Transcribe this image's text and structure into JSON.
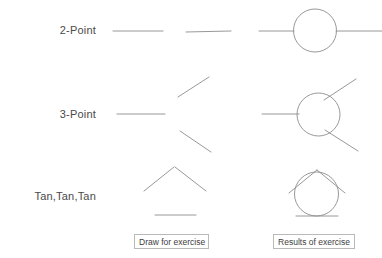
{
  "page": {
    "background_color": "#ffffff",
    "ink_color": "#8c8c8c",
    "text_color": "#3d3d3d",
    "width": 382,
    "height": 258
  },
  "rows": [
    {
      "id": "2-point",
      "label": "2-Point"
    },
    {
      "id": "3-point",
      "label": "3-Point"
    },
    {
      "id": "tan-tan-tan",
      "label": "Tan,Tan,Tan"
    }
  ],
  "captions": {
    "draw": "Draw for exercise",
    "results": "Results of exercise"
  },
  "figures": {
    "row_2point": {
      "draw_lines": [
        {
          "x1": 113,
          "y1": 31,
          "x2": 163,
          "y2": 31
        },
        {
          "x1": 186,
          "y1": 32,
          "x2": 231,
          "y2": 31
        }
      ],
      "result_lines": [
        {
          "x1": 259,
          "y1": 31,
          "x2": 294,
          "y2": 31
        },
        {
          "x1": 336,
          "y1": 31,
          "x2": 382,
          "y2": 31
        }
      ],
      "result_circles": [
        {
          "cx": 315,
          "cy": 30.5,
          "r": 21.5
        }
      ]
    },
    "row_3point": {
      "draw_lines": [
        {
          "x1": 117,
          "y1": 114,
          "x2": 165,
          "y2": 114
        },
        {
          "x1": 178,
          "y1": 97,
          "x2": 209,
          "y2": 77
        },
        {
          "x1": 180,
          "y1": 131,
          "x2": 211,
          "y2": 152
        }
      ],
      "result_lines": [
        {
          "x1": 262,
          "y1": 114,
          "x2": 299,
          "y2": 114
        },
        {
          "x1": 324,
          "y1": 100,
          "x2": 356,
          "y2": 79
        },
        {
          "x1": 325,
          "y1": 130,
          "x2": 358,
          "y2": 151
        }
      ],
      "result_circles": [
        {
          "cx": 318.5,
          "cy": 114.5,
          "r": 21.5
        }
      ]
    },
    "row_tantantan": {
      "draw_lines": [
        {
          "x1": 144,
          "y1": 191,
          "x2": 174,
          "y2": 167
        },
        {
          "x1": 175,
          "y1": 167,
          "x2": 206,
          "y2": 191
        },
        {
          "x1": 155,
          "y1": 215,
          "x2": 196,
          "y2": 215
        }
      ],
      "result_lines": [
        {
          "x1": 289,
          "y1": 193,
          "x2": 317,
          "y2": 170
        },
        {
          "x1": 317,
          "y1": 170,
          "x2": 345,
          "y2": 193
        },
        {
          "x1": 296,
          "y1": 216,
          "x2": 338,
          "y2": 216
        }
      ],
      "result_circles": [
        {
          "cx": 316.5,
          "cy": 194,
          "r": 22
        }
      ]
    }
  }
}
